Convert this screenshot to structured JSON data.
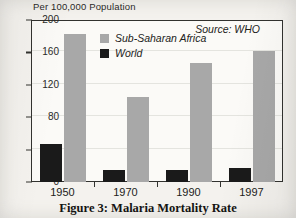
{
  "figure": {
    "caption": "Figure 3: Malaria Mortality Rate",
    "source_note": "Source: WHO"
  },
  "colors": {
    "africa": "#a8a8a8",
    "world": "#1a1a1a",
    "axis": "#32322f",
    "paper": "#f4f2ee"
  },
  "chart_data": {
    "type": "bar",
    "title": "",
    "ylabel": "Per 100,000 Population",
    "xlabel": "",
    "categories": [
      "1950",
      "1970",
      "1990",
      "1997"
    ],
    "series": [
      {
        "name": "World",
        "color": "#1a1a1a",
        "values": [
          47,
          15,
          15,
          17
        ]
      },
      {
        "name": "Sub-Saharan Africa",
        "color": "#a8a8a8",
        "values": [
          183,
          105,
          147,
          162
        ]
      }
    ],
    "ylim": [
      0,
      200
    ],
    "yticks": [
      0,
      40,
      80,
      120,
      160,
      200
    ],
    "grid": true,
    "legend_position": "inside-top-left",
    "annotations": [
      "Source: WHO"
    ]
  }
}
